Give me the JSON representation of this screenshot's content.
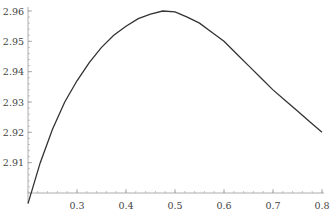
{
  "chart_data": {
    "type": "line",
    "title": "",
    "xlabel": "",
    "ylabel": "",
    "xlim": [
      0.2,
      0.8
    ],
    "ylim": [
      2.9,
      2.96
    ],
    "grid": false,
    "legend": null,
    "x_ticks": [
      "0.3",
      "0.4",
      "0.5",
      "0.6",
      "0.7",
      "0.8"
    ],
    "y_ticks": [
      "2.91",
      "2.92",
      "2.93",
      "2.94",
      "2.95",
      "2.96"
    ],
    "series": [
      {
        "name": "curve",
        "color": "#333333",
        "x": [
          0.2,
          0.225,
          0.25,
          0.275,
          0.3,
          0.325,
          0.35,
          0.375,
          0.4,
          0.425,
          0.45,
          0.475,
          0.5,
          0.525,
          0.55,
          0.575,
          0.6,
          0.625,
          0.65,
          0.675,
          0.7,
          0.725,
          0.75,
          0.775,
          0.8
        ],
        "values": [
          2.8965,
          2.91,
          2.921,
          2.93,
          2.937,
          2.943,
          2.948,
          2.952,
          2.955,
          2.9575,
          2.959,
          2.96,
          2.9597,
          2.958,
          2.956,
          2.953,
          2.95,
          2.946,
          2.942,
          2.938,
          2.934,
          2.9305,
          2.927,
          2.9235,
          2.92
        ]
      }
    ]
  }
}
